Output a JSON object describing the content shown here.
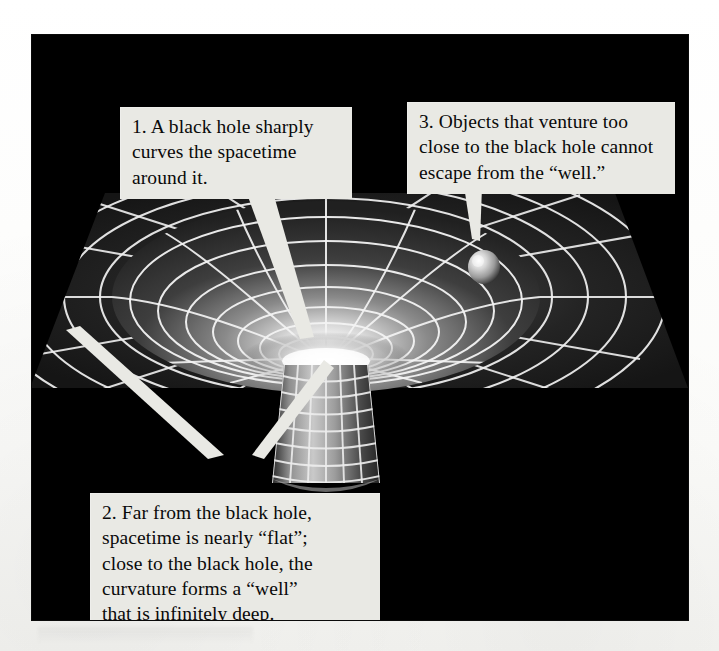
{
  "figure": {
    "panel_background": "#000000",
    "page_background": "#ffffff",
    "title_alt": "Spacetime curvature around a black hole",
    "scene": {
      "name": "gravity-well-diagram",
      "grid_color": "#f2f2f2",
      "plane_color": "#1a1a1a",
      "well_glow_color": "#f5f5f5",
      "sphere_label": "orbiting object",
      "tube_label": "infinite well shaft"
    }
  },
  "callouts": [
    {
      "id": "callout-1",
      "number": "1.",
      "lines": [
        "1. A black hole sharply",
        "curves the spacetime",
        "around it."
      ],
      "text": "1. A black hole sharply curves the spacetime around it."
    },
    {
      "id": "callout-2",
      "number": "2.",
      "lines": [
        "2. Far from the black hole,",
        "spacetime is nearly “flat”;",
        "close to the black hole, the",
        "curvature forms a “well”",
        "that is infinitely deep."
      ],
      "text": "2. Far from the black hole, spacetime is nearly “flat”; close to the black hole, the curvature forms a “well” that is infinitely deep."
    },
    {
      "id": "callout-3",
      "number": "3.",
      "lines": [
        "3. Objects that venture too",
        "close to the black hole cannot",
        "escape from the “well.”"
      ],
      "text": "3. Objects that venture too close to the black hole cannot escape from the “well.”"
    }
  ]
}
